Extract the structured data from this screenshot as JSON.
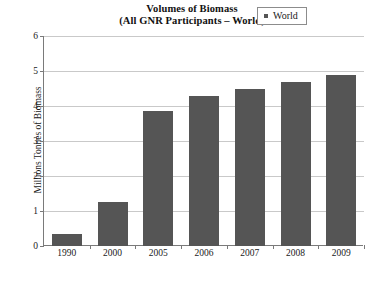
{
  "chart_data": {
    "type": "bar",
    "title": "Volumes of Biomass",
    "subtitle": "(All GNR Participants – World)",
    "title_lines": [
      "Volumes of Biomass",
      "(All GNR Participants – World)"
    ],
    "xlabel": "",
    "ylabel": "Millions Tonnes of Biomass",
    "categories": [
      "1990",
      "2000",
      "2005",
      "2006",
      "2007",
      "2008",
      "2009"
    ],
    "series": [
      {
        "name": "World",
        "values": [
          0.35,
          1.25,
          3.85,
          4.3,
          4.5,
          4.7,
          4.9
        ]
      }
    ],
    "ylim": [
      0,
      6
    ],
    "ytick_labels": [
      "0",
      "1",
      "2",
      "3",
      "4",
      "5",
      "6"
    ],
    "ytick_values": [
      0,
      1,
      2,
      3,
      4,
      5,
      6
    ],
    "grid": "horizontal",
    "legend_position": "top-right",
    "legend_entries": [
      {
        "label": "World",
        "marker": "square",
        "color": "#555555"
      }
    ],
    "colors": {
      "bar_fill": "#555555",
      "gridline": "#c9c9c9",
      "axis": "#7a7a7a",
      "background": "#ffffff",
      "text": "#1a1a1a"
    }
  }
}
